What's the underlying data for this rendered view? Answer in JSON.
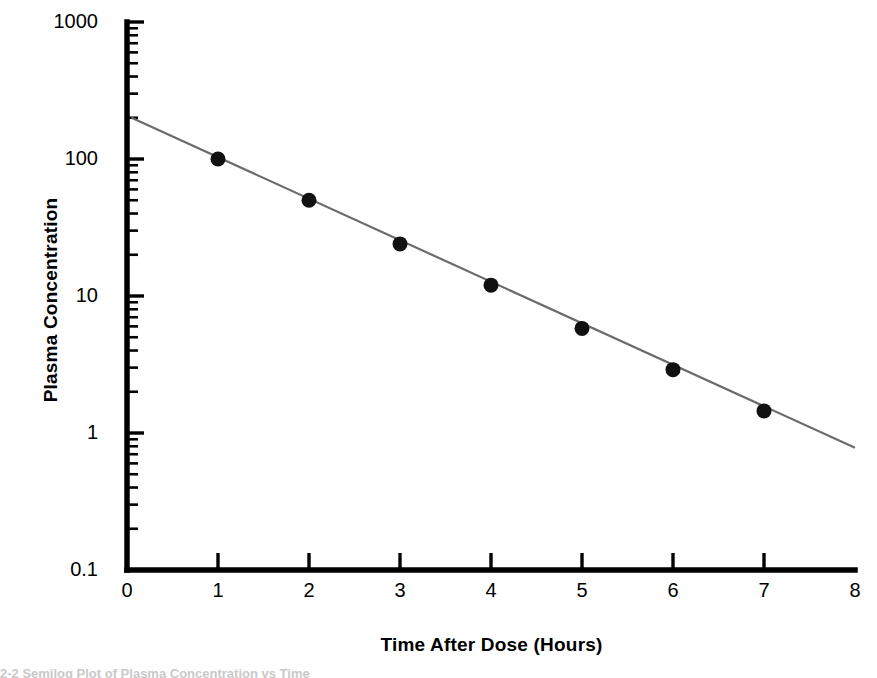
{
  "figure": {
    "title": "",
    "caption_fragment": "2-2  Semilog Plot of Plasma Concentration vs Time"
  },
  "chart_data": {
    "type": "scatter",
    "title": "",
    "subtitle": "",
    "xlabel": "Time After Dose (Hours)",
    "ylabel": "Plasma Concentration",
    "xscale": "linear",
    "yscale": "log",
    "xlim": [
      0,
      8
    ],
    "ylim": [
      0.1,
      1000
    ],
    "grid": false,
    "legend": null,
    "x_ticks": [
      0,
      1,
      2,
      3,
      4,
      5,
      6,
      7,
      8
    ],
    "x_tick_labels": [
      "0",
      "1",
      "2",
      "3",
      "4",
      "5",
      "6",
      "7",
      "8"
    ],
    "y_ticks": [
      0.1,
      1,
      10,
      100,
      1000
    ],
    "y_tick_labels": [
      "0.1",
      "1",
      "10",
      "100",
      "1000"
    ],
    "y_minor_ticks": true,
    "series": [
      {
        "name": "Plasma concentration",
        "type": "scatter",
        "marker": "filled-circle",
        "color": "#111111",
        "marker_size": 15,
        "x": [
          1,
          2,
          3,
          4,
          5,
          6,
          7
        ],
        "y": [
          100,
          50,
          24,
          12,
          5.8,
          2.9,
          1.45
        ]
      },
      {
        "name": "Log-linear regression line",
        "type": "line",
        "color": "#6b6b6b",
        "line_width": 2.2,
        "x": [
          0.05,
          8.0
        ],
        "y": [
          200,
          0.78
        ]
      }
    ],
    "annotations": []
  },
  "axes": {
    "y_axis_name": "plasma-concentration-axis",
    "x_axis_name": "time-after-dose-axis",
    "axis_color": "#000000",
    "axis_width": 5
  },
  "colors": {
    "background": "#ffffff",
    "axis": "#000000",
    "marker": "#111111",
    "line": "#6b6b6b",
    "text": "#000000"
  }
}
